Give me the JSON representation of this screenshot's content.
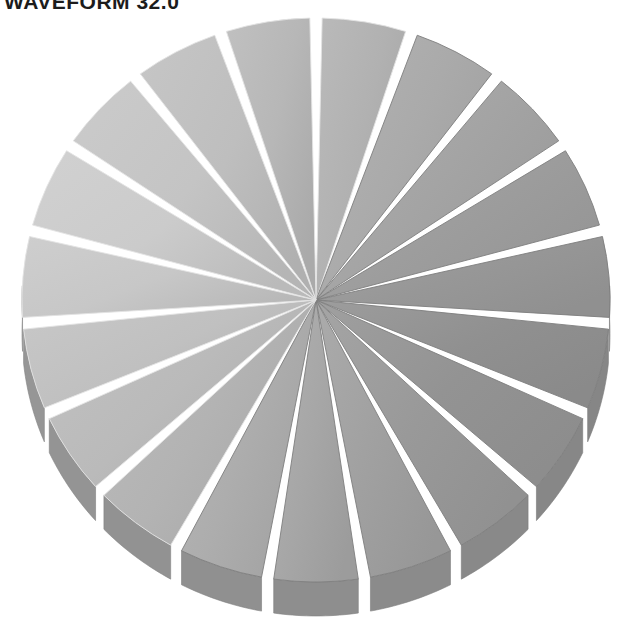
{
  "title": "WAVEFORM 32.0",
  "chart_data": {
    "type": "pie",
    "title": "WAVEFORM 32.0",
    "subtitle": "",
    "xlabel": "",
    "ylabel": "",
    "legend": "none",
    "grid": false,
    "exploded": true,
    "three_d": true,
    "slice_count": 19,
    "categories": [
      "Slice 1",
      "Slice 2",
      "Slice 3",
      "Slice 4",
      "Slice 5",
      "Slice 6",
      "Slice 7",
      "Slice 8",
      "Slice 9",
      "Slice 10",
      "Slice 11",
      "Slice 12",
      "Slice 13",
      "Slice 14",
      "Slice 15",
      "Slice 16",
      "Slice 17",
      "Slice 18",
      "Slice 19"
    ],
    "values": [
      5.26,
      5.26,
      5.26,
      5.26,
      5.26,
      5.26,
      5.26,
      5.26,
      5.26,
      5.26,
      5.26,
      5.26,
      5.26,
      5.26,
      5.26,
      5.26,
      5.26,
      5.26,
      5.26
    ],
    "units": "percent",
    "start_angle_deg": -90,
    "geometry": {
      "center_x": 316,
      "center_y": 300,
      "radius_x": 294,
      "radius_y": 282,
      "depth_px": 34,
      "explode_gap_deg": 2.4
    },
    "colors": {
      "background": "#ffffff",
      "title": "#1c1c1c",
      "front_light": "#cccccc",
      "back_dark": "#8e8e8e",
      "side_wall": "#9a9a9a",
      "edge_highlight": "#e3e3e3",
      "edge_shadow": "#7e7e7e"
    },
    "shading": {
      "light_direction": "upper-left",
      "lightest_angle_deg": 200,
      "darkest_angle_deg": 20
    }
  }
}
